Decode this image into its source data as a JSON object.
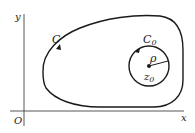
{
  "diagram": {
    "axes": {
      "x_label": "x",
      "y_label": "y",
      "origin_label": "O"
    },
    "contour_outer": {
      "label": "C",
      "orientation": "counterclockwise"
    },
    "contour_inner": {
      "label_main": "C",
      "label_sub": "0",
      "orientation": "counterclockwise"
    },
    "center_point": {
      "label_main": "z",
      "label_sub": "0"
    },
    "radius": {
      "label": "ρ"
    },
    "colors": {
      "stroke": "#1a1a1a",
      "axis": "#444444",
      "background": "#ffffff"
    }
  }
}
